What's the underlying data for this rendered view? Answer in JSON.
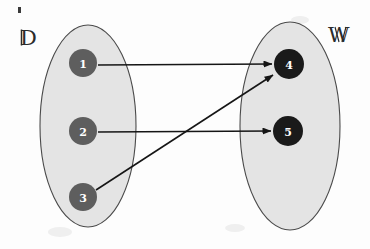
{
  "diagram": {
    "type": "function-mapping-diagram",
    "background_color": "#fdfdfd",
    "ink_color": "#161616",
    "sets": [
      {
        "id": "domain",
        "label": "D̵",
        "label_text": "D",
        "label_style": "blackboard-bold",
        "fill_color": "#e4e4e4",
        "stroke_color": "#4a4a4a",
        "cx": 88,
        "cy": 126,
        "rx": 48,
        "ry": 101,
        "label_x": 26,
        "label_y": 45
      },
      {
        "id": "codomain",
        "label": "W",
        "label_text": "W",
        "label_style": "blackboard-bold",
        "fill_color": "#e4e4e4",
        "stroke_color": "#4a4a4a",
        "cx": 290,
        "cy": 126,
        "rx": 50,
        "ry": 104,
        "label_x": 330,
        "label_y": 42
      }
    ],
    "nodes": [
      {
        "id": "n1",
        "label": "1",
        "set": "domain",
        "cx": 83,
        "cy": 63,
        "r": 14,
        "color": "#5e5e5e",
        "text_color": "#ffffff"
      },
      {
        "id": "n2",
        "label": "2",
        "set": "domain",
        "cx": 83,
        "cy": 131,
        "r": 14,
        "color": "#5e5e5e",
        "text_color": "#ffffff"
      },
      {
        "id": "n3",
        "label": "3",
        "set": "domain",
        "cx": 83,
        "cy": 197,
        "r": 14,
        "color": "#5e5e5e",
        "text_color": "#ffffff"
      },
      {
        "id": "n4",
        "label": "4",
        "set": "codomain",
        "cx": 289,
        "cy": 64,
        "r": 15,
        "color": "#1a1a1a",
        "text_color": "#ffffff"
      },
      {
        "id": "n5",
        "label": "5",
        "set": "codomain",
        "cx": 288,
        "cy": 131,
        "r": 15,
        "color": "#1a1a1a",
        "text_color": "#ffffff"
      }
    ],
    "edges": [
      {
        "id": "e1",
        "from": "n1",
        "to": "n4",
        "label": "1 to 4",
        "x1": 98,
        "y1": 65,
        "x2": 272,
        "y2": 64
      },
      {
        "id": "e2",
        "from": "n2",
        "to": "n5",
        "label": "2 to 5",
        "x1": 98,
        "y1": 132,
        "x2": 271,
        "y2": 131
      },
      {
        "id": "e3",
        "from": "n3",
        "to": "n4",
        "label": "3 to 4",
        "x1": 96,
        "y1": 190,
        "x2": 273,
        "y2": 75
      }
    ],
    "artifacts": [
      {
        "id": "speck",
        "x": 18,
        "y": 7,
        "w": 3,
        "h": 6
      }
    ]
  }
}
